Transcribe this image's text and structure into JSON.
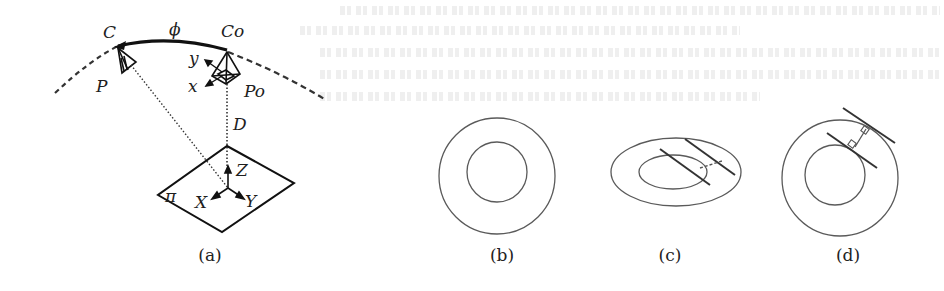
{
  "figure": {
    "panels": [
      {
        "id": "a",
        "caption": "(a)",
        "description": "Camera moving on a spherical arc about a planar target",
        "labels": {
          "camera": "C",
          "camera_origin": "Co",
          "arc_angle": "ϕ",
          "pose": "P",
          "pose_origin": "Po",
          "axis_y_small": "y",
          "axis_x_small": "x",
          "distance": "D",
          "plane": "π",
          "axis_X": "X",
          "axis_Y": "Y",
          "axis_Z": "Z"
        }
      },
      {
        "id": "b",
        "caption": "(b)",
        "description": "Two concentric circles (fronto-parallel view)"
      },
      {
        "id": "c",
        "caption": "(c)",
        "description": "Two concentric ellipses with tangent lines joined by dashed segment"
      },
      {
        "id": "d",
        "caption": "(d)",
        "description": "Concentric circles with parallel tangents and perpendicular connector"
      }
    ]
  },
  "colors": {
    "ink": "#1e1e1e",
    "thin_ink": "#5a5a5a",
    "background": "#ffffff"
  }
}
